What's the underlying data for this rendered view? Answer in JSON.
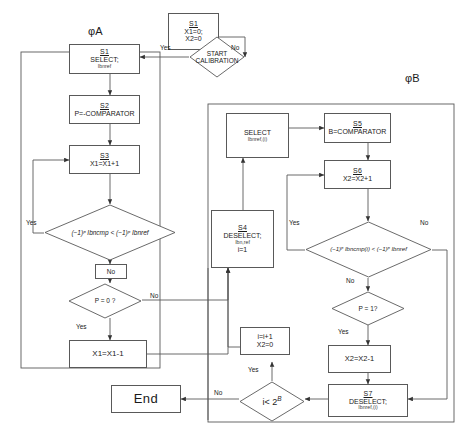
{
  "figure": {
    "type": "flowchart",
    "groups": [
      {
        "id": "phiA",
        "label": "φA"
      },
      {
        "id": "phiB",
        "label": "φB"
      }
    ]
  },
  "nodes": {
    "init": {
      "sid": "S1",
      "line1": "X1=0;",
      "line2": "X2=0"
    },
    "start_calibration": {
      "line1": "START",
      "line2": "CALIBRATION"
    },
    "a_s1": {
      "sid": "S1",
      "line1": "SELECT;",
      "sub": "Ibnref"
    },
    "a_s2": {
      "sid": "S2",
      "line1": "P=-COMPARATOR"
    },
    "a_s3": {
      "sid": "S3",
      "line1": "X1=X1+1"
    },
    "a_cmp": {
      "text": "(−1)ᵖ Ibncmp < (−1)ᵖ Ibnref"
    },
    "a_no_tag": {
      "label": "No"
    },
    "a_p0": {
      "text": "P = 0 ?"
    },
    "a_dec": {
      "line1": "X1=X1-1"
    },
    "s4": {
      "sid": "S4",
      "line1": "DESELECT;",
      "sub": "Ibn,ref",
      "line2": "i=1"
    },
    "b_select": {
      "line1": "SELECT",
      "sub": "Ibnref,(i)"
    },
    "b_s5": {
      "sid": "S5",
      "line1": "B=COMPARATOR"
    },
    "b_s6": {
      "sid": "S6",
      "line1": "X2=X2+1"
    },
    "b_cmp": {
      "text": "(−1)ᵖ Ibncmp(i) < (−1)ᵖ Ibnref"
    },
    "b_no_tag": {
      "label": "No"
    },
    "b_p1": {
      "text": "P = 1?"
    },
    "b_dec": {
      "line1": "X2=X2-1"
    },
    "b_s7": {
      "sid": "S7",
      "line1": "DESELECT;",
      "sub": "Ibnref,(i)"
    },
    "loop_inc": {
      "line1": "i=i+1",
      "line2": "X2=0"
    },
    "loop_test": {
      "text": "i< 2",
      "exp": "B"
    },
    "end": {
      "label": "End"
    }
  },
  "edge_labels": {
    "start_yes": "Yes",
    "start_no": "No",
    "a_cmp_yes": "Yes",
    "a_p0_no": "No",
    "a_p0_yes": "Yes",
    "b_cmp_yes": "Yes",
    "b_cmp_no": "No",
    "b_p1_yes": "Yes",
    "loop_yes": "Yes",
    "loop_no": "No"
  },
  "colors": {
    "stroke": "#595959",
    "text": "#1a1a1a",
    "background": "#ffffff"
  }
}
